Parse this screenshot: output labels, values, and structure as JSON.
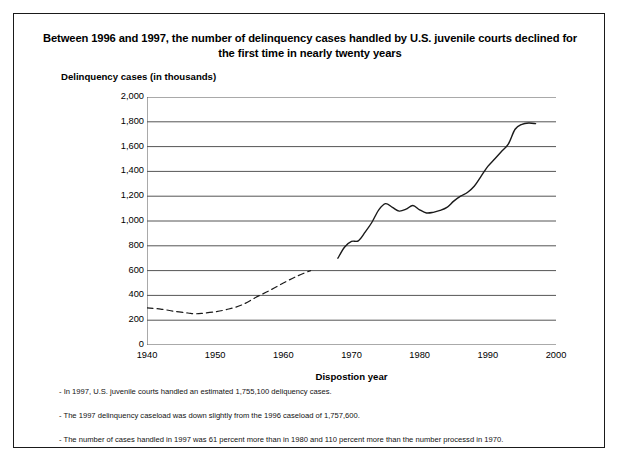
{
  "figure": {
    "title": "Between 1996 and 1997, the number of delinquency cases handled by U.S. juvenile courts declined for the first time in nearly twenty years",
    "y_axis_title": "Delinquency cases (in thousands)",
    "x_axis_title": "Dispostion year",
    "notes": [
      "- In 1997, U.S. juvenile courts handled an estimated 1,755,100 deliquency cases.",
      "- The 1997 delinquency caseload was down slightly from the 1996 caseload of 1,757,600.",
      "- The number of cases handled in 1997 was 61 percent more than in 1980 and 110 percent more than the number processd in 1970."
    ],
    "line_color": "#1a1a1a",
    "grid_color": "#555555"
  },
  "chart_data": {
    "type": "line",
    "title": "Between 1996 and 1997, the number of delinquency cases handled by U.S. juvenile courts declined for the first time in nearly twenty years",
    "xlabel": "Dispostion year",
    "ylabel": "Delinquency cases (in thousands)",
    "xlim": [
      1940,
      2000
    ],
    "ylim": [
      0,
      2000
    ],
    "xticks": [
      1940,
      1950,
      1960,
      1970,
      1980,
      1990,
      2000
    ],
    "yticks": [
      0,
      200,
      400,
      600,
      800,
      1000,
      1200,
      1400,
      1600,
      1800,
      2000
    ],
    "ytick_labels": [
      "0",
      "200",
      "400",
      "600",
      "800",
      "1,000",
      "1,200",
      "1,400",
      "1,600",
      "1,800",
      "2,000"
    ],
    "xtick_labels": [
      "1940",
      "1950",
      "1960",
      "1970",
      "1980",
      "1990",
      "2000"
    ],
    "grid": "horizontal",
    "legend": "none",
    "series": [
      {
        "name": "Delinquency cases (estimated, dashed)",
        "style": "dashed",
        "x": [
          1940,
          1942,
          1944,
          1946,
          1947,
          1948,
          1950,
          1952,
          1954,
          1956,
          1958,
          1960,
          1962,
          1964
        ],
        "values": [
          300,
          290,
          272,
          258,
          252,
          255,
          268,
          290,
          325,
          385,
          440,
          500,
          555,
          600
        ]
      },
      {
        "name": "Delinquency cases (reported, solid)",
        "style": "solid",
        "x": [
          1968,
          1969,
          1970,
          1971,
          1972,
          1973,
          1974,
          1975,
          1976,
          1977,
          1978,
          1979,
          1980,
          1981,
          1982,
          1983,
          1984,
          1985,
          1986,
          1987,
          1988,
          1989,
          1990,
          1991,
          1992,
          1993,
          1994,
          1995,
          1996,
          1997
        ],
        "values": [
          700,
          790,
          835,
          840,
          910,
          990,
          1090,
          1140,
          1110,
          1080,
          1095,
          1125,
          1090,
          1065,
          1070,
          1085,
          1110,
          1160,
          1200,
          1230,
          1280,
          1360,
          1440,
          1500,
          1560,
          1620,
          1740,
          1780,
          1790,
          1785
        ]
      }
    ]
  }
}
